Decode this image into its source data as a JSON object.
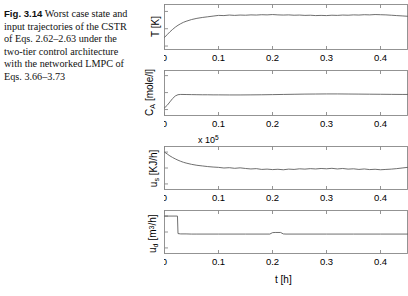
{
  "caption": {
    "figure_number": "Fig. 3.14",
    "text": "Worst case state and input trajectories of the CSTR of Eqs. 2.62–2.63 under the two-tier control architecture with the networked LMPC of Eqs. 3.66–3.73"
  },
  "figure": {
    "xlabel": "t [h]",
    "xticks": [
      "0",
      "0.1",
      "0.2",
      "0.3",
      "0.4"
    ],
    "xtick_values": [
      0,
      0.1,
      0.2,
      0.3,
      0.4
    ],
    "xlim": [
      0,
      0.45
    ],
    "line_color": "#555555",
    "axis_color": "#888888"
  },
  "chart_data": [
    {
      "type": "line",
      "panel": "temperature",
      "title": "",
      "xlabel": "t [h]",
      "ylabel": "T [K]",
      "ylabel_parts": {
        "symbol": "T",
        "sub": "",
        "unit": "[K]"
      },
      "yticks": [
        "370",
        "380",
        "390"
      ],
      "ytick_values": [
        370,
        380,
        390
      ],
      "ylim": [
        368,
        394
      ],
      "xlim": [
        0,
        0.45
      ],
      "grid": false,
      "multiplier": "",
      "series": [
        {
          "name": "T",
          "x": [
            0,
            0.005,
            0.01,
            0.015,
            0.02,
            0.025,
            0.03,
            0.035,
            0.04,
            0.05,
            0.06,
            0.07,
            0.08,
            0.09,
            0.1,
            0.11,
            0.12,
            0.13,
            0.14,
            0.15,
            0.16,
            0.17,
            0.18,
            0.19,
            0.2,
            0.21,
            0.22,
            0.23,
            0.24,
            0.25,
            0.26,
            0.27,
            0.28,
            0.29,
            0.3,
            0.31,
            0.32,
            0.33,
            0.34,
            0.35,
            0.36,
            0.37,
            0.38,
            0.39,
            0.4,
            0.41,
            0.42,
            0.43,
            0.44,
            0.45
          ],
          "y": [
            375.0,
            376.6,
            378.2,
            379.6,
            380.9,
            382.0,
            382.9,
            383.7,
            384.3,
            385.3,
            386.0,
            386.5,
            386.9,
            387.3,
            387.7,
            387.6,
            387.9,
            387.7,
            387.9,
            387.8,
            388.0,
            387.9,
            388.1,
            388.0,
            388.2,
            388.0,
            387.9,
            388.0,
            387.8,
            387.9,
            387.7,
            387.8,
            387.6,
            387.7,
            387.6,
            387.8,
            387.7,
            387.9,
            387.8,
            388.0,
            387.9,
            388.1,
            388.0,
            388.2,
            388.1,
            388.0,
            387.8,
            387.6,
            387.4,
            387.2
          ]
        }
      ]
    },
    {
      "type": "line",
      "panel": "concentration",
      "title": "",
      "xlabel": "t [h]",
      "ylabel": "C_A [mole/l]",
      "ylabel_parts": {
        "symbol": "C",
        "sub": "A",
        "unit": "[mole/l]"
      },
      "yticks": [
        "3.4",
        "3.6",
        "3.8"
      ],
      "ytick_values": [
        3.4,
        3.6,
        3.8
      ],
      "ylim": [
        3.33,
        3.86
      ],
      "xlim": [
        0,
        0.45
      ],
      "grid": false,
      "multiplier": "",
      "series": [
        {
          "name": "C_A",
          "x": [
            0,
            0.005,
            0.01,
            0.015,
            0.02,
            0.025,
            0.03,
            0.04,
            0.05,
            0.06,
            0.07,
            0.08,
            0.09,
            0.1,
            0.12,
            0.14,
            0.16,
            0.18,
            0.2,
            0.22,
            0.24,
            0.26,
            0.28,
            0.3,
            0.32,
            0.34,
            0.36,
            0.38,
            0.4,
            0.42,
            0.44,
            0.45
          ],
          "y": [
            3.42,
            3.45,
            3.49,
            3.53,
            3.56,
            3.575,
            3.578,
            3.577,
            3.576,
            3.575,
            3.574,
            3.574,
            3.573,
            3.573,
            3.572,
            3.572,
            3.573,
            3.574,
            3.576,
            3.578,
            3.58,
            3.582,
            3.583,
            3.584,
            3.584,
            3.583,
            3.582,
            3.581,
            3.58,
            3.579,
            3.578,
            3.578
          ]
        }
      ]
    },
    {
      "type": "line",
      "panel": "heat_input",
      "title": "",
      "xlabel": "t [h]",
      "ylabel": "u_s [KJ/h]",
      "ylabel_parts": {
        "symbol": "u",
        "sub": "s",
        "unit": "[KJ/h]"
      },
      "yticks": [
        "-1",
        "0",
        "1"
      ],
      "ytick_values": [
        -1,
        0,
        1
      ],
      "ylim": [
        -1.35,
        1.35
      ],
      "xlim": [
        0,
        0.45
      ],
      "grid": false,
      "multiplier": "x 10^5",
      "series": [
        {
          "name": "u_s",
          "x": [
            0,
            0.005,
            0.01,
            0.015,
            0.02,
            0.025,
            0.03,
            0.035,
            0.04,
            0.05,
            0.06,
            0.07,
            0.08,
            0.09,
            0.1,
            0.11,
            0.12,
            0.13,
            0.14,
            0.15,
            0.16,
            0.17,
            0.18,
            0.19,
            0.2,
            0.21,
            0.22,
            0.23,
            0.24,
            0.25,
            0.26,
            0.27,
            0.28,
            0.29,
            0.3,
            0.31,
            0.32,
            0.33,
            0.34,
            0.35,
            0.36,
            0.37,
            0.38,
            0.39,
            0.4,
            0.41,
            0.42,
            0.43,
            0.44,
            0.45
          ],
          "y": [
            1.0,
            0.88,
            0.76,
            0.66,
            0.57,
            0.49,
            0.42,
            0.36,
            0.31,
            0.23,
            0.17,
            0.13,
            0.09,
            0.06,
            0.04,
            0.0,
            0.02,
            -0.02,
            0.01,
            -0.03,
            -0.06,
            -0.04,
            -0.09,
            -0.07,
            -0.1,
            -0.08,
            -0.11,
            -0.07,
            -0.09,
            -0.05,
            -0.07,
            -0.04,
            -0.06,
            -0.03,
            -0.05,
            -0.02,
            -0.06,
            -0.03,
            -0.07,
            -0.05,
            -0.09,
            -0.06,
            -0.1,
            -0.08,
            -0.11,
            -0.09,
            -0.07,
            -0.04,
            0.0,
            0.04
          ]
        }
      ]
    },
    {
      "type": "line",
      "panel": "flow_input",
      "title": "",
      "xlabel": "t [h]",
      "ylabel": "u_d [m^3/h]",
      "ylabel_parts": {
        "symbol": "u",
        "sub": "d",
        "unit": "[m",
        "unit_sup": "3",
        "unit_tail": "/h]"
      },
      "yticks": [
        "-1",
        "0",
        "1"
      ],
      "ytick_values": [
        -1,
        0,
        1
      ],
      "ylim": [
        -1.35,
        1.35
      ],
      "xlim": [
        0,
        0.45
      ],
      "grid": false,
      "multiplier": "",
      "series": [
        {
          "name": "u_d",
          "x": [
            0,
            0.024,
            0.025,
            0.03,
            0.04,
            0.05,
            0.06,
            0.1,
            0.15,
            0.195,
            0.2,
            0.205,
            0.215,
            0.22,
            0.225,
            0.3,
            0.35,
            0.4,
            0.45
          ],
          "y": [
            1.0,
            1.0,
            -0.1,
            -0.12,
            -0.12,
            -0.13,
            -0.13,
            -0.13,
            -0.13,
            -0.13,
            -0.04,
            -0.03,
            -0.03,
            -0.12,
            -0.13,
            -0.13,
            -0.13,
            -0.13,
            -0.13
          ]
        }
      ]
    }
  ]
}
